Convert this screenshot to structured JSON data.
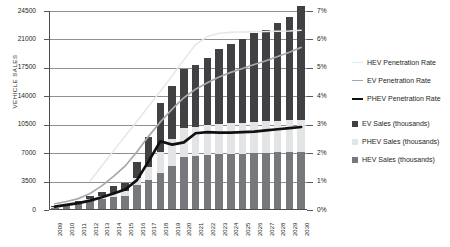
{
  "chart_data": {
    "type": "bar",
    "title": "",
    "subtitle": "",
    "xlabel": "",
    "ylabel": "VEHICLE SALES",
    "y2label": "",
    "grid": true,
    "legend_position": "right",
    "ylim": [
      0,
      24500
    ],
    "y2lim": [
      0,
      7
    ],
    "ytick_labels": [
      "0",
      "3500",
      "7000",
      "10500",
      "14000",
      "17500",
      "21000",
      "24500"
    ],
    "ytick_values": [
      0,
      3500,
      7000,
      10500,
      14000,
      17500,
      21000,
      24500
    ],
    "y2tick_labels": [
      "0%",
      "1%",
      "2%",
      "3%",
      "4%",
      "5%",
      "6%",
      "7%"
    ],
    "y2tick_values": [
      0,
      1,
      2,
      3,
      4,
      5,
      6,
      7
    ],
    "categories": [
      "2009",
      "2010",
      "2011",
      "2012",
      "2013",
      "2014",
      "2015",
      "2016",
      "2017",
      "2018",
      "2019",
      "2020",
      "2021",
      "2022",
      "2023",
      "2024",
      "2025",
      "2026",
      "2027",
      "2028",
      "2029",
      "2030"
    ],
    "series": [
      {
        "name": "HEV Sales (thousands)",
        "axis": "left",
        "kind": "bar-stack",
        "color": "#77787b",
        "values": [
          330,
          560,
          780,
          1150,
          1350,
          1600,
          1750,
          3050,
          3650,
          4500,
          5400,
          6500,
          6600,
          6750,
          6850,
          6900,
          6950,
          7000,
          7050,
          7100,
          7150,
          7200
        ]
      },
      {
        "name": "PHEV Sales (thousands)",
        "axis": "left",
        "kind": "bar-stack",
        "color": "#e3e4e6",
        "values": [
          30,
          60,
          120,
          200,
          330,
          500,
          620,
          900,
          1600,
          2700,
          3300,
          3600,
          3650,
          3700,
          3750,
          3800,
          3800,
          3850,
          3850,
          3900,
          3900,
          3900
        ]
      },
      {
        "name": "EV Sales (thousands)",
        "axis": "left",
        "kind": "bar-stack",
        "color": "#414042",
        "values": [
          100,
          140,
          210,
          330,
          520,
          800,
          1000,
          2000,
          3750,
          6000,
          6600,
          7300,
          7650,
          8300,
          9250,
          9800,
          10300,
          10900,
          11300,
          12000,
          12700,
          14000
        ]
      },
      {
        "name": "HEV Penetration Rate",
        "axis": "right",
        "kind": "line",
        "color": "#e6e7e8",
        "values": [
          null,
          null,
          null,
          1.02,
          1.55,
          2.08,
          2.6,
          3.12,
          3.65,
          4.18,
          4.72,
          5.28,
          5.82,
          6.1,
          6.22,
          6.25,
          6.26,
          6.27,
          6.28,
          6.29,
          6.3,
          6.32
        ]
      },
      {
        "name": "EV Penetration Rate",
        "axis": "right",
        "kind": "line",
        "color": "#a7a9ac",
        "values": [
          0.22,
          0.3,
          0.4,
          0.58,
          0.85,
          1.18,
          1.55,
          2.05,
          2.6,
          3.1,
          3.55,
          3.95,
          4.25,
          4.48,
          4.68,
          4.84,
          4.98,
          5.12,
          5.25,
          5.4,
          5.55,
          5.72
        ]
      },
      {
        "name": "PHEV Penetration Rate",
        "axis": "right",
        "kind": "line",
        "color": "#101010",
        "values": [
          0.12,
          0.18,
          0.24,
          0.33,
          0.45,
          0.58,
          0.72,
          1.05,
          1.72,
          2.42,
          2.3,
          2.38,
          2.7,
          2.74,
          2.72,
          2.72,
          2.74,
          2.76,
          2.8,
          2.84,
          2.88,
          2.92
        ]
      }
    ],
    "legend_entries": [
      {
        "label": "HEV Penetration Rate",
        "marker": "line",
        "color": "#e6e7e8",
        "thickness": 1.4
      },
      {
        "label": "EV Penetration Rate",
        "marker": "line",
        "color": "#a7a9ac",
        "thickness": 1.6
      },
      {
        "label": "PHEV Penetration Rate",
        "marker": "line",
        "color": "#101010",
        "thickness": 2.6
      },
      {
        "label": "EV Sales (thousands)",
        "marker": "box",
        "color": "#414042"
      },
      {
        "label": "PHEV Sales (thousands)",
        "marker": "box",
        "color": "#e3e4e6"
      },
      {
        "label": "HEV Sales (thousands)",
        "marker": "box",
        "color": "#77787b"
      }
    ]
  }
}
